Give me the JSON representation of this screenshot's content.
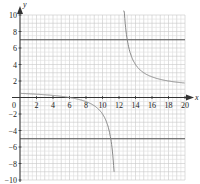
{
  "chart_data": {
    "type": "line",
    "title": "",
    "xlabel": "x",
    "ylabel": "y",
    "xlim": [
      0,
      20
    ],
    "ylim": [
      -10,
      10
    ],
    "grid": true,
    "x_ticks": [
      "2",
      "4",
      "6",
      "8",
      "10",
      "12",
      "14",
      "16",
      "18",
      "20"
    ],
    "y_ticks": [
      "10",
      "8",
      "6",
      "4",
      "2",
      "-2",
      "-4",
      "-6",
      "-8",
      "-10"
    ],
    "origin_label": "0",
    "series": [
      {
        "name": "f(x) = 1 + 6/(x-12)",
        "x": [
          0,
          2,
          4,
          6,
          8,
          10,
          11,
          11.5,
          12.5,
          13,
          14,
          16,
          18,
          20
        ],
        "y": [
          0.5,
          0.4,
          0.25,
          0,
          -0.5,
          -2,
          -5,
          -11,
          13,
          7,
          4,
          2.5,
          2,
          1.75
        ]
      }
    ],
    "reference_lines": [
      {
        "orientation": "horizontal",
        "y": 7
      },
      {
        "orientation": "horizontal",
        "y": -5
      }
    ]
  }
}
